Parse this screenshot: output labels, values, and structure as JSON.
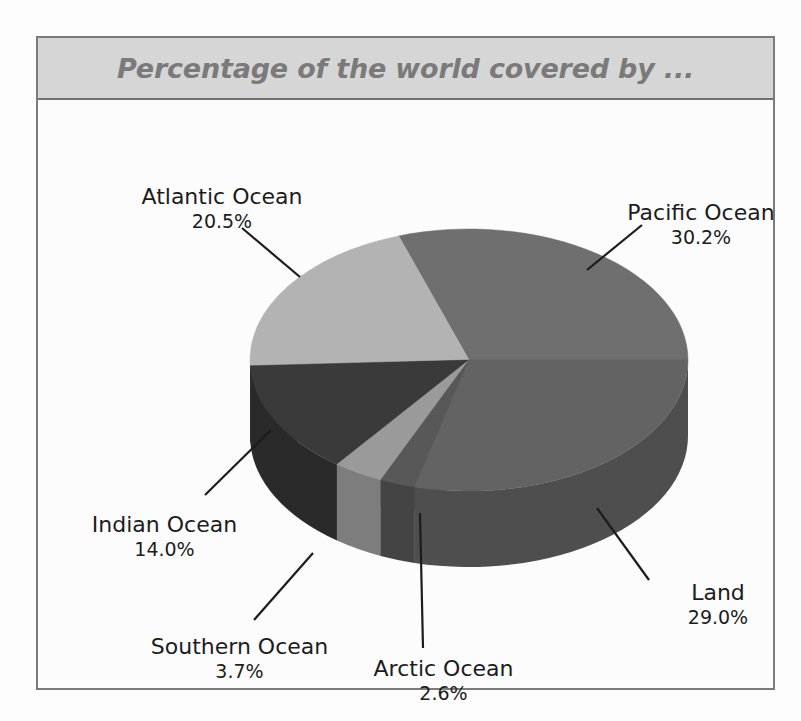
{
  "figure": {
    "title": "Percentage of the world covered by ...",
    "title_bg": "#d6d6d6",
    "title_color": "#7a7a7a",
    "frame_color": "#7b7b7b",
    "plot_bg": "#fcfcfc"
  },
  "chart_data": {
    "type": "pie",
    "title": "Percentage of the world covered by ...",
    "xlabel": "",
    "ylabel": "",
    "three_d": true,
    "legend": "none",
    "labels_position": "outside-with-leader-lines",
    "categories": [
      "Pacific Ocean",
      "Atlantic Ocean",
      "Indian Ocean",
      "Southern Ocean",
      "Arctic Ocean",
      "Land"
    ],
    "values": [
      30.2,
      20.5,
      14.0,
      3.7,
      2.6,
      29.0
    ],
    "value_suffix": "%",
    "total": 100.0,
    "slices": [
      {
        "name": "Pacific Ocean",
        "value": 30.2,
        "value_text": "30.2%",
        "top_color": "#6f6f6f",
        "side_color": "#5a5a5a",
        "start_angle": 0,
        "sweep": 108.72
      },
      {
        "name": "Atlantic Ocean",
        "value": 20.5,
        "value_text": "20.5%",
        "top_color": "#b3b3b3",
        "side_color": "#8f8f8f",
        "start_angle": 108.72,
        "sweep": 73.8
      },
      {
        "name": "Indian Ocean",
        "value": 14.0,
        "value_text": "14.0%",
        "top_color": "#3a3a3a",
        "side_color": "#2a2a2a",
        "start_angle": 182.52,
        "sweep": 50.4
      },
      {
        "name": "Southern Ocean",
        "value": 3.7,
        "value_text": "3.7%",
        "top_color": "#9a9a9a",
        "side_color": "#7d7d7d",
        "start_angle": 232.92,
        "sweep": 13.32
      },
      {
        "name": "Arctic Ocean",
        "value": 2.6,
        "value_text": "2.6%",
        "top_color": "#585858",
        "side_color": "#444444",
        "start_angle": 246.24,
        "sweep": 9.36
      },
      {
        "name": "Land",
        "value": 29.0,
        "value_text": "29.0%",
        "top_color": "#636363",
        "side_color": "#4e4e4e",
        "start_angle": 255.6,
        "sweep": 104.4
      }
    ],
    "geometry": {
      "cx": 431,
      "cy": 260,
      "rx": 219,
      "ry": 131,
      "depth": 76
    },
    "leader_lines": [
      {
        "name": "Atlantic Ocean",
        "x1": 204,
        "y1": 128,
        "x2": 262,
        "y2": 177
      },
      {
        "name": "Pacific Ocean",
        "x1": 604,
        "y1": 125,
        "x2": 549,
        "y2": 170
      },
      {
        "name": "Indian Ocean",
        "x1": 167,
        "y1": 395,
        "x2": 233,
        "y2": 330
      },
      {
        "name": "Southern Ocean",
        "x1": 216,
        "y1": 520,
        "x2": 275,
        "y2": 453
      },
      {
        "name": "Arctic Ocean",
        "x1": 385,
        "y1": 548,
        "x2": 382,
        "y2": 413
      },
      {
        "name": "Land",
        "x1": 611,
        "y1": 480,
        "x2": 559,
        "y2": 408
      }
    ]
  },
  "labels": {
    "atlantic": {
      "name": "Atlantic Ocean",
      "value": "20.5%"
    },
    "pacific": {
      "name": "Pacific Ocean",
      "value": "30.2%"
    },
    "indian": {
      "name": "Indian Ocean",
      "value": "14.0%"
    },
    "southern": {
      "name": "Southern Ocean",
      "value": "3.7%"
    },
    "arctic": {
      "name": "Arctic Ocean",
      "value": "2.6%"
    },
    "land": {
      "name": "Land",
      "value": "29.0%"
    }
  }
}
